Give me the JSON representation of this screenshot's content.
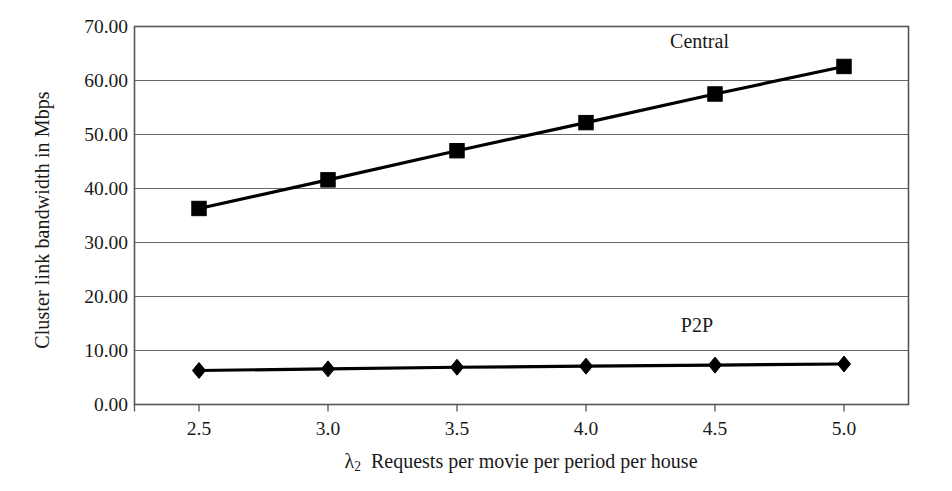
{
  "chart_data": {
    "type": "line",
    "title": "",
    "xlabel": "λ2  Requests per movie per period per house",
    "xlabel_symbol": "λ",
    "xlabel_subscript": "2",
    "xlabel_rest": "Requests per movie per period per house",
    "ylabel": "Cluster link bandwidth in Mbps",
    "x": [
      2.5,
      3.0,
      3.5,
      4.0,
      4.5,
      5.0
    ],
    "xticklabels": [
      "2.5",
      "3.0",
      "3.5",
      "4.0",
      "4.5",
      "5.0"
    ],
    "yticks": [
      0.0,
      10.0,
      20.0,
      30.0,
      40.0,
      50.0,
      60.0,
      70.0
    ],
    "yticklabels": [
      "0.00",
      "10.00",
      "20.00",
      "30.00",
      "40.00",
      "50.00",
      "60.00",
      "70.00"
    ],
    "xlim": [
      2.25,
      5.25
    ],
    "ylim": [
      0.0,
      70.0
    ],
    "grid": "horizontal",
    "legend": "inline-annotations",
    "series": [
      {
        "name": "Central",
        "marker": "square",
        "color": "#000000",
        "values": [
          36.3,
          41.6,
          47.0,
          52.2,
          57.5,
          62.6
        ],
        "label_x": 4.44,
        "label_y": 67.2
      },
      {
        "name": "P2P",
        "marker": "diamond",
        "color": "#000000",
        "values": [
          6.3,
          6.6,
          6.9,
          7.1,
          7.3,
          7.5
        ],
        "label_x": 4.43,
        "label_y": 14.6
      }
    ]
  },
  "style": {
    "axis_color": "#555555",
    "grid_color": "#666666",
    "series_color": "#000000",
    "background": "#ffffff"
  }
}
